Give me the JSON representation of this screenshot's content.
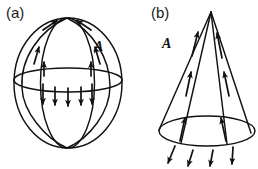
{
  "figure": {
    "width": 258,
    "height": 169,
    "background_color": "#ffffff",
    "stroke_color": "#111111",
    "panels": [
      {
        "id": "a",
        "caption": "(a)",
        "subject": "sphere",
        "field_label": "A",
        "description": "Sphere with meridian great circles and equator; vector field arrows tangent on upper hemisphere pointing toward the north pole and arrows pointing downward below the equator",
        "geometry": {
          "center_x": 68,
          "center_y": 83,
          "radius_x": 54,
          "radius_y": 65,
          "north_pole_x": 67,
          "north_pole_y": 18,
          "south_pole_x": 67,
          "south_pole_y": 148,
          "equator_y": 80,
          "equator_rx": 54,
          "equator_ry": 12,
          "meridian_half_widths": [
            54,
            26
          ],
          "downward_arrow_count": 5,
          "downward_arrow_y_start": 86,
          "downward_arrow_y_end": 105
        }
      },
      {
        "id": "b",
        "caption": "(b)",
        "subject": "cone",
        "field_label": "A",
        "description": "Cone with apex at top and elliptical base; vector field arrows along the slant lines pointing up toward the apex and arrows below the base pointing down and outward",
        "geometry": {
          "apex_x": 82,
          "apex_y": 12,
          "base_center_x": 78,
          "base_center_y": 131,
          "base_rx": 48,
          "base_ry": 15,
          "slant_line_count": 4,
          "below_base_arrow_count": 4
        }
      }
    ]
  }
}
